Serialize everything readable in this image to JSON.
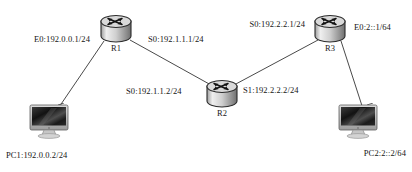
{
  "diagram": {
    "type": "network-topology",
    "background": "#ffffff",
    "link_color": "#4a4a4a",
    "nodes": [
      {
        "id": "R1",
        "kind": "router",
        "label": "R1",
        "x": 116,
        "y": 29,
        "label_x": 116,
        "label_y": 43
      },
      {
        "id": "R2",
        "kind": "router",
        "label": "R2",
        "x": 222,
        "y": 94,
        "label_x": 222,
        "label_y": 108
      },
      {
        "id": "R3",
        "kind": "router",
        "label": "R3",
        "x": 330,
        "y": 29,
        "label_x": 330,
        "label_y": 43
      },
      {
        "id": "PC1",
        "kind": "pc",
        "label": "PC1:192.0.0.2/24",
        "x": 51,
        "y": 122,
        "label_x": 6,
        "label_y": 150
      },
      {
        "id": "PC2",
        "kind": "pc",
        "label": "PC2:2::2/64",
        "x": 360,
        "y": 122,
        "label_x": 406,
        "label_y": 148
      }
    ],
    "links": [
      {
        "from": "PC1",
        "to": "R1",
        "x1": 55,
        "y1": 113,
        "x2": 104,
        "y2": 41
      },
      {
        "from": "R1",
        "to": "R2",
        "x1": 130,
        "y1": 40,
        "x2": 211,
        "y2": 85
      },
      {
        "from": "R2",
        "to": "R3",
        "x1": 234,
        "y1": 85,
        "x2": 318,
        "y2": 40
      },
      {
        "from": "R3",
        "to": "PC2",
        "x1": 341,
        "y1": 41,
        "x2": 364,
        "y2": 112
      }
    ],
    "interfaces": [
      {
        "id": "r1-e0",
        "text": "E0:192.0.0.1/24",
        "x": 90,
        "y": 39,
        "align": "r"
      },
      {
        "id": "r1-s0",
        "text": "S0:192.1.1.1/24",
        "x": 148,
        "y": 39,
        "align": "l"
      },
      {
        "id": "r2-s0",
        "text": "S0:192.1.1.2/24",
        "x": 126,
        "y": 91,
        "align": "l"
      },
      {
        "id": "r2-s1",
        "text": "S1:192.2.2.2/24",
        "x": 243,
        "y": 90,
        "align": "l"
      },
      {
        "id": "r3-s0",
        "text": "S0:192.2.2.1/24",
        "x": 305,
        "y": 24,
        "align": "r"
      },
      {
        "id": "r3-e0",
        "text": "E0:2::1/64",
        "x": 354,
        "y": 27,
        "align": "l"
      }
    ]
  }
}
